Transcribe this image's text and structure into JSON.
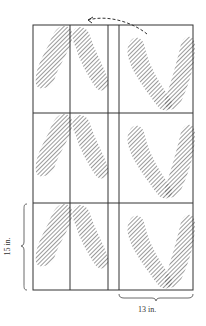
{
  "diagram": {
    "dimensions": {
      "width_label": "13 in.",
      "height_label": "15 in."
    },
    "grid": {
      "rows": 3,
      "columns": 2
    },
    "arrow": {
      "style": "dashed",
      "direction": "right-to-left curved"
    },
    "colors": {
      "line": "#333333",
      "hatch": "#555555",
      "background": "#ffffff"
    }
  }
}
